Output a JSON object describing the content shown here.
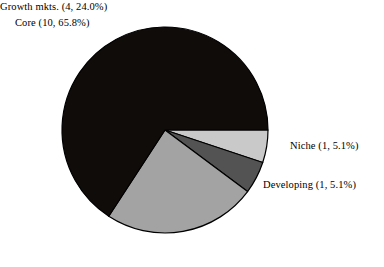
{
  "chart_data": {
    "type": "pie",
    "title": "",
    "subtitle": "",
    "xlabel": "",
    "ylabel": "",
    "legend_position": "none",
    "grid": false,
    "start_angle_deg": 0,
    "direction": "clockwise",
    "total_count": 16,
    "categories": [
      "Niche",
      "Developing",
      "Growth mkts.",
      "Core"
    ],
    "values": [
      5.1,
      5.1,
      24.0,
      65.8
    ],
    "counts": [
      1,
      1,
      4,
      10
    ],
    "colors": [
      "#c9c9c9",
      "#535353",
      "#a3a3a3",
      "#100c0a"
    ],
    "slices": [
      {
        "name": "Niche",
        "count": 1,
        "percent": 5.1,
        "label": "Niche (1,  5.1%)",
        "color": "#c9c9c9",
        "start_deg": 0,
        "end_deg": 18.4
      },
      {
        "name": "Developing",
        "count": 1,
        "percent": 5.1,
        "label": "Developing (1,  5.1%)",
        "color": "#535353",
        "start_deg": 18.4,
        "end_deg": 36.7
      },
      {
        "name": "Growth mkts.",
        "count": 4,
        "percent": 24.0,
        "label": "Growth mkts. (4,  24.0%)",
        "color": "#a3a3a3",
        "start_deg": 36.7,
        "end_deg": 123.1
      },
      {
        "name": "Core",
        "count": 10,
        "percent": 65.8,
        "label": "Core (10,  65.8%)",
        "color": "#100c0a",
        "start_deg": 123.1,
        "end_deg": 360
      }
    ],
    "geometry": {
      "center_x": 165,
      "center_y": 130,
      "radius": 103,
      "outline_color": "#000000",
      "outline_width": 1.2
    }
  }
}
